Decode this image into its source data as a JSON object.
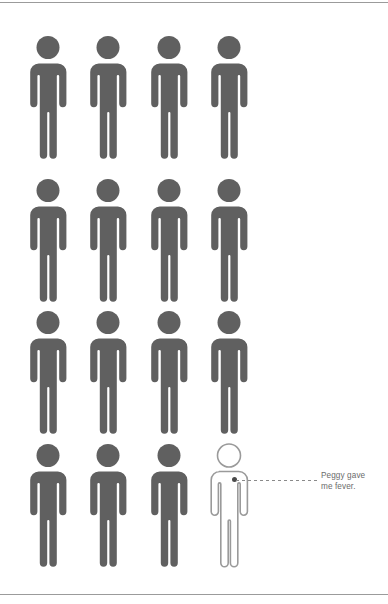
{
  "page": {
    "background_color": "#ffffff",
    "width": 388,
    "height": 604,
    "rule_color": "#9b9b9b"
  },
  "pictogram": {
    "type": "isotype-unit-chart",
    "filled_color": "#606060",
    "outline_color": "#9a9a9a",
    "rows": 4,
    "columns": 4,
    "total_figures": 16,
    "filled_figures": 15,
    "outlined_figures": 1,
    "figures": [
      {
        "id": "figure-r1c1",
        "row": 1,
        "col": 1,
        "state": "filled"
      },
      {
        "id": "figure-r1c2",
        "row": 1,
        "col": 2,
        "state": "filled"
      },
      {
        "id": "figure-r1c3",
        "row": 1,
        "col": 3,
        "state": "filled"
      },
      {
        "id": "figure-r1c4",
        "row": 1,
        "col": 4,
        "state": "filled"
      },
      {
        "id": "figure-r2c1",
        "row": 2,
        "col": 1,
        "state": "filled"
      },
      {
        "id": "figure-r2c2",
        "row": 2,
        "col": 2,
        "state": "filled"
      },
      {
        "id": "figure-r2c3",
        "row": 2,
        "col": 3,
        "state": "filled"
      },
      {
        "id": "figure-r2c4",
        "row": 2,
        "col": 4,
        "state": "filled"
      },
      {
        "id": "figure-r3c1",
        "row": 3,
        "col": 1,
        "state": "filled"
      },
      {
        "id": "figure-r3c2",
        "row": 3,
        "col": 2,
        "state": "filled"
      },
      {
        "id": "figure-r3c3",
        "row": 3,
        "col": 3,
        "state": "filled"
      },
      {
        "id": "figure-r3c4",
        "row": 3,
        "col": 4,
        "state": "filled"
      },
      {
        "id": "figure-r4c1",
        "row": 4,
        "col": 1,
        "state": "filled"
      },
      {
        "id": "figure-r4c2",
        "row": 4,
        "col": 2,
        "state": "filled"
      },
      {
        "id": "figure-r4c3",
        "row": 4,
        "col": 3,
        "state": "filled"
      },
      {
        "id": "figure-r4c4",
        "row": 4,
        "col": 4,
        "state": "outlined"
      }
    ]
  },
  "callout": {
    "target_figure": "figure-r4c4",
    "dot_color": "#4a4a4a",
    "line_color": "#8a8a8a",
    "line_style": "dashed",
    "text_color": "#6b6b6b",
    "text_line_1": "Peggy gave",
    "text_line_2": "me fever.",
    "text_full": "Peggy gave me fever."
  },
  "chart_data": {
    "type": "pictogram",
    "title": "",
    "categories": [
      "highlighted",
      "other"
    ],
    "values": [
      1,
      15
    ],
    "unit_total": 16,
    "annotations": [
      "Peggy gave me fever."
    ],
    "xlabel": "",
    "ylabel": ""
  }
}
